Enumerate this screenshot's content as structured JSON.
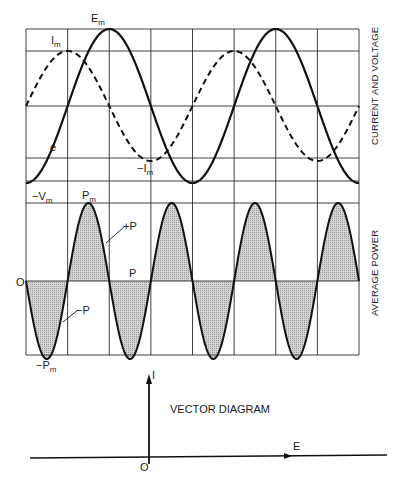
{
  "figure": {
    "top_panel": {
      "side_title": "CURRENT AND VOLTAGE",
      "labels": {
        "em_main": "E",
        "em_sub": "m",
        "im_main": "I",
        "im_sub": "m",
        "neg_im_main": "−I",
        "neg_im_sub": "m",
        "e": "e"
      }
    },
    "bottom_panel": {
      "side_title": "AVERAGE POWER",
      "labels": {
        "neg_vm_main": "−V",
        "neg_vm_sub": "m",
        "pm_main": "P",
        "pm_sub": "m",
        "plus_p": "+P",
        "p": "P",
        "zero": "O",
        "minus_p": "−P",
        "neg_pm_main": "−P",
        "neg_pm_sub": "m"
      }
    },
    "vector_diagram": {
      "title": "VECTOR DIAGRAM",
      "i_label": "I",
      "e_label": "E",
      "origin_label": "O"
    }
  },
  "chart_data": [
    {
      "type": "line",
      "title": "CURRENT AND VOLTAGE",
      "description": "Voltage e (solid) and current i (dashed) in a purely capacitive circuit; current leads voltage by 90 degrees",
      "x_unit": "degrees",
      "x": [
        0,
        90,
        180,
        270,
        360,
        450,
        540,
        630,
        720
      ],
      "series": [
        {
          "name": "e (voltage, solid)",
          "amplitude_label": "Em",
          "values": [
            -1,
            0,
            1,
            0,
            -1,
            0,
            1,
            0,
            -1
          ]
        },
        {
          "name": "i (current, dashed)",
          "amplitude_label": "Im",
          "values": [
            0,
            0.66,
            0,
            -0.66,
            0,
            0.66,
            0,
            -0.66,
            0
          ]
        }
      ],
      "annotations": [
        "Em",
        "Im",
        "-Im",
        "e"
      ],
      "grid": true
    },
    {
      "type": "area",
      "title": "AVERAGE POWER",
      "description": "Instantaneous power p = e*i oscillates at double frequency with equal +P and -P areas; average power P is zero",
      "x_unit": "degrees",
      "x": [
        0,
        45,
        90,
        135,
        180,
        225,
        270,
        315,
        360,
        405,
        450,
        495,
        540,
        585,
        630,
        675,
        720
      ],
      "series": [
        {
          "name": "p (instantaneous power)",
          "values": [
            0,
            -1,
            0,
            1,
            0,
            -1,
            0,
            1,
            0,
            -1,
            0,
            1,
            0,
            -1,
            0,
            1,
            0
          ]
        }
      ],
      "annotations": [
        "-Vm",
        "Pm",
        "+P",
        "P",
        "O",
        "-P",
        "-Pm"
      ],
      "average_power": 0,
      "grid": true
    },
    {
      "type": "vector",
      "title": "VECTOR DIAGRAM",
      "vectors": [
        {
          "name": "I",
          "angle_deg": 90
        },
        {
          "name": "E",
          "angle_deg": 0
        }
      ]
    }
  ]
}
